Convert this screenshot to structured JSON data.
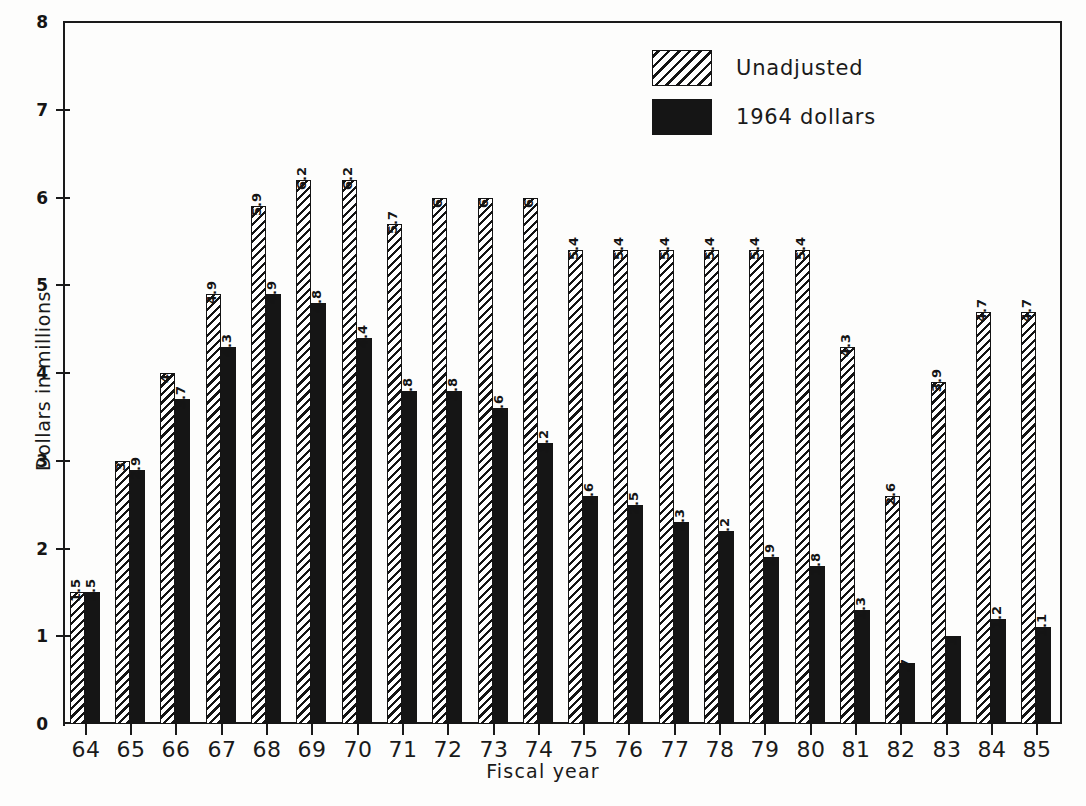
{
  "chart_data": {
    "type": "bar",
    "title": "",
    "subtitle": "",
    "xlabel": "Fiscal year",
    "ylabel": "Dollars in millions",
    "ylim": [
      0,
      8
    ],
    "yticks": [
      0,
      1,
      2,
      3,
      4,
      5,
      6,
      7,
      8
    ],
    "ytick_labels": [
      "0",
      "1",
      "2",
      "3",
      "4",
      "5",
      "6",
      "7",
      "8"
    ],
    "grid": false,
    "legend_position": "top-right",
    "categories": [
      "64",
      "65",
      "66",
      "67",
      "68",
      "69",
      "70",
      "71",
      "72",
      "73",
      "74",
      "75",
      "76",
      "77",
      "78",
      "79",
      "80",
      "81",
      "82",
      "83",
      "84",
      "85"
    ],
    "series": [
      {
        "name": "Unadjusted",
        "style": "hatched",
        "color": "#141414",
        "values": [
          1.5,
          3,
          4,
          4.9,
          5.9,
          6.2,
          6.2,
          5.7,
          6,
          6,
          6,
          5.4,
          5.4,
          5.4,
          5.4,
          5.4,
          5.4,
          4.3,
          2.6,
          3.9,
          4.7,
          4.7
        ],
        "value_labels": [
          "1.5",
          "3",
          "4",
          "4.9",
          "5.9",
          "6.2",
          "6.2",
          "5.7",
          "6",
          "6",
          "6",
          "5.4",
          "5.4",
          "5.4",
          "5.4",
          "5.4",
          "5.4",
          "4.3",
          "2.6",
          "3.9",
          "4.7",
          "4.7"
        ]
      },
      {
        "name": "1964 dollars",
        "style": "solid",
        "color": "#151515",
        "values": [
          1.5,
          2.9,
          3.7,
          4.3,
          4.9,
          4.8,
          4.4,
          3.8,
          3.8,
          3.6,
          3.2,
          2.6,
          2.5,
          2.3,
          2.2,
          1.9,
          1.8,
          1.3,
          0.7,
          1,
          1.2,
          1.1
        ],
        "value_labels": [
          "1.5",
          "2.9",
          "3.7",
          "4.3",
          "4.9",
          "4.8",
          "4.4",
          "3.8",
          "3.8",
          "3.6",
          "3.2",
          "2.6",
          "2.5",
          "2.3",
          "2.2",
          "1.9",
          "1.8",
          "1.3",
          ".7",
          "1",
          "1.2",
          "1.1"
        ]
      }
    ]
  },
  "legend": {
    "items": [
      {
        "label": "Unadjusted",
        "style": "hatched"
      },
      {
        "label": "1964 dollars",
        "style": "solid"
      }
    ]
  },
  "axes": {
    "y_title": "Dollars in millions",
    "x_title": "Fiscal year"
  }
}
